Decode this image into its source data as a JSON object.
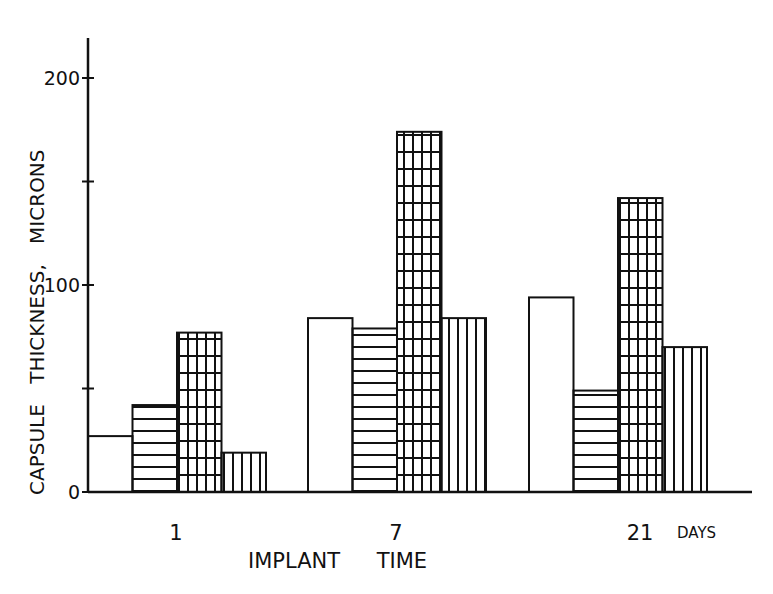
{
  "chart_data": {
    "type": "bar",
    "title": "",
    "xlabel": "IMPLANT TIME",
    "ylabel": "CAPSULE THICKNESS, MICRONS",
    "x_unit_label": "DAYS",
    "categories": [
      "1",
      "7",
      "21"
    ],
    "series": [
      {
        "name": "open (unfilled)",
        "pattern": "none",
        "values": [
          27,
          84,
          94
        ]
      },
      {
        "name": "horizontal hatch",
        "pattern": "horizontal",
        "values": [
          42,
          79,
          49
        ]
      },
      {
        "name": "grid hatch",
        "pattern": "grid",
        "values": [
          77,
          174,
          142
        ]
      },
      {
        "name": "vertical hatch",
        "pattern": "vertical",
        "values": [
          19,
          84,
          70
        ]
      }
    ],
    "yticks": [
      0,
      50,
      100,
      150,
      200
    ],
    "ytick_labels": [
      "0",
      "",
      "100",
      "",
      "200"
    ],
    "ylim": [
      0,
      220
    ],
    "grid": false,
    "legend": null
  },
  "colors": {
    "ink": "#111111",
    "background": "#ffffff"
  }
}
